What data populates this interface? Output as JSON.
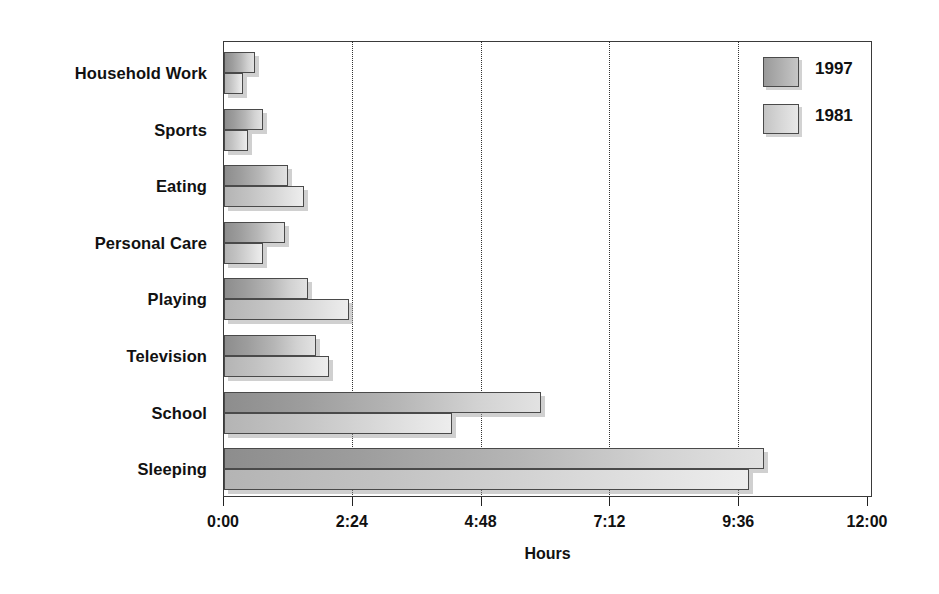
{
  "chart_data": {
    "type": "bar",
    "orientation": "horizontal",
    "title": "",
    "xlabel": "Hours",
    "ylabel": "",
    "categories": [
      "Household Work",
      "Sports",
      "Eating",
      "Personal Care",
      "Playing",
      "Television",
      "School",
      "Sleeping"
    ],
    "series": [
      {
        "name": "1997",
        "color": "#9d9d9d",
        "values": [
          0.58,
          0.73,
          1.19,
          1.14,
          1.57,
          1.71,
          5.91,
          10.06
        ],
        "value_labels": [
          "0:35",
          "0:44",
          "1:11",
          "1:08",
          "1:34",
          "1:43",
          "5:55",
          "10:04"
        ]
      },
      {
        "name": "1981",
        "color": "#d2d2d2",
        "values": [
          0.35,
          0.45,
          1.49,
          0.73,
          2.33,
          1.96,
          4.25,
          9.78
        ],
        "value_labels": [
          "0:21",
          "0:27",
          "1:29",
          "0:44",
          "2:00",
          "1:57",
          "4:15",
          "9:47"
        ]
      }
    ],
    "xlim": [
      0,
      12
    ],
    "xticks": [
      0,
      2.4,
      4.8,
      7.2,
      9.6,
      12
    ],
    "xtick_labels": [
      "0:00",
      "2:24",
      "4:48",
      "7:12",
      "9:36",
      "12:00"
    ],
    "grid": "vertical-dotted",
    "legend_position": "top-right",
    "legend_entries": [
      "1997",
      "1981"
    ]
  },
  "axis": {
    "x_title": "Hours",
    "tick_labels": [
      "0:00",
      "2:24",
      "4:48",
      "7:12",
      "9:36",
      "12:00"
    ]
  },
  "legend": {
    "items": [
      {
        "label": "1997"
      },
      {
        "label": "1981"
      }
    ]
  }
}
